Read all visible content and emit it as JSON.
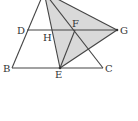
{
  "diagram": {
    "type": "geometry",
    "points": {
      "A": {
        "x": 44,
        "y": -8,
        "label": ""
      },
      "B": {
        "x": 12,
        "y": 68,
        "label": "B"
      },
      "C": {
        "x": 103,
        "y": 68,
        "label": "C"
      },
      "D": {
        "x": 27,
        "y": 30,
        "label": "D"
      },
      "E": {
        "x": 60,
        "y": 68,
        "label": "E"
      },
      "F": {
        "x": 75,
        "y": 30,
        "label": "F"
      },
      "G": {
        "x": 117,
        "y": 30,
        "label": "G"
      },
      "H": {
        "x": 52,
        "y": 30,
        "label": "H"
      }
    },
    "labels": {
      "D": "D",
      "H": "H",
      "F": "F",
      "G": "G",
      "B": "B",
      "E": "E",
      "C": "C"
    },
    "shaded_region": "triangle AEG",
    "colors": {
      "stroke": "#444444",
      "fill": "#d9d9d9",
      "label": "#333333"
    }
  }
}
